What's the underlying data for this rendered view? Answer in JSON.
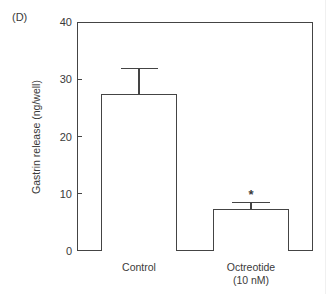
{
  "panel_label": "(D)",
  "chart_data": {
    "type": "bar",
    "title": "",
    "xlabel": "",
    "ylabel": "Gastrin release (ng/well)",
    "ylim": [
      0,
      40
    ],
    "yticks": [
      0,
      10,
      20,
      30,
      40
    ],
    "categories": [
      "Control",
      "Octreotide (10 nM)"
    ],
    "category_lines": [
      [
        "Control"
      ],
      [
        "Octreotide",
        "(10 nM)"
      ]
    ],
    "values": [
      27.5,
      7.3
    ],
    "error_upper": [
      4.5,
      1.3
    ],
    "annotations": [
      {
        "category": "Octreotide (10 nM)",
        "text": "*",
        "meaning": "significant vs control"
      }
    ],
    "grid": false,
    "legend": null
  },
  "axis": {
    "tick_labels": [
      "0",
      "10",
      "20",
      "30",
      "40"
    ],
    "ylabel": "Gastrin release (ng/well)"
  },
  "bars": [
    {
      "label_line1": "Control",
      "label_line2": ""
    },
    {
      "label_line1": "Octreotide",
      "label_line2": "(10 nM)",
      "marker": "*"
    }
  ]
}
